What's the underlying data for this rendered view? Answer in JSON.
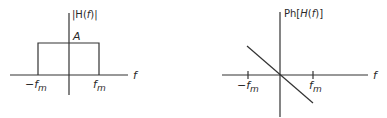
{
  "magnitude_plot": {
    "ylabel": "|H(f)|",
    "ylabel_prefix": "|H(",
    "ylabel_var": "f",
    "ylabel_suffix": ")|",
    "xlabel": "f",
    "amplitude_label": "A",
    "neg_cutoff_label": "−f",
    "pos_cutoff_label": "f",
    "cutoff_subscript": "m",
    "shape": "rectangular passband from −f_m to f_m with height A"
  },
  "phase_plot": {
    "ylabel": "Ph[H(f)]",
    "ylabel_prefix": "Ph[",
    "ylabel_H": "H",
    "ylabel_mid": "(",
    "ylabel_var": "f",
    "ylabel_suffix": ")]",
    "xlabel": "f",
    "neg_cutoff_label": "−f",
    "pos_cutoff_label": "f",
    "cutoff_subscript": "m",
    "shape": "straight line with negative slope passing through origin, spanning −f_m to f_m"
  },
  "colors": {
    "line": "#333333",
    "text": "#2a2a2a",
    "background": "#ffffff"
  }
}
